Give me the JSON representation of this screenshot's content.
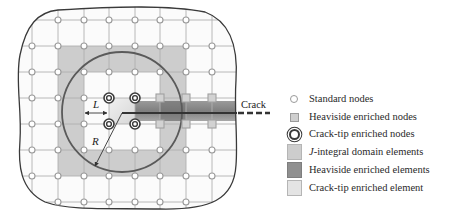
{
  "figure": {
    "grid": {
      "x_lines": [
        32,
        58,
        84,
        109,
        135,
        160,
        186,
        212
      ],
      "y_lines": [
        20,
        46,
        72,
        98,
        124,
        150,
        176,
        202
      ]
    },
    "labels": {
      "crack": "Crack",
      "L": "L",
      "R": "R"
    },
    "crack_tip": {
      "x": 122,
      "y": 113
    },
    "circle": {
      "cx": 122,
      "cy": 113,
      "r": 60
    },
    "colors": {
      "grid_line": "#b0b0b0",
      "boundary": "#3a3a3a",
      "circle": "#5a5a5a",
      "j_integral_fill": "#cdcdcd",
      "heaviside_fill": "#8f8f8f",
      "crack_tip_fill": "#e4e4e4",
      "crack_line": "#333333"
    }
  },
  "legend": {
    "items": [
      {
        "key": "standard_nodes",
        "label": "Standard nodes",
        "icon": "circle-node-icon"
      },
      {
        "key": "heaviside_nodes",
        "label": "Heaviside enriched nodes",
        "icon": "square-node-icon"
      },
      {
        "key": "crack_tip_nodes",
        "label": "Crack-tip enriched nodes",
        "icon": "double-circle-node-icon"
      },
      {
        "key": "j_integral_elements",
        "label_prefix": "J",
        "label": "-integral domain elements",
        "icon": "light-gray-box-icon"
      },
      {
        "key": "heaviside_elements",
        "label": "Heaviside enriched elements",
        "icon": "dark-gray-box-icon"
      },
      {
        "key": "crack_tip_element",
        "label": "Crack-tip enriched element",
        "icon": "pale-gray-box-icon"
      }
    ]
  }
}
